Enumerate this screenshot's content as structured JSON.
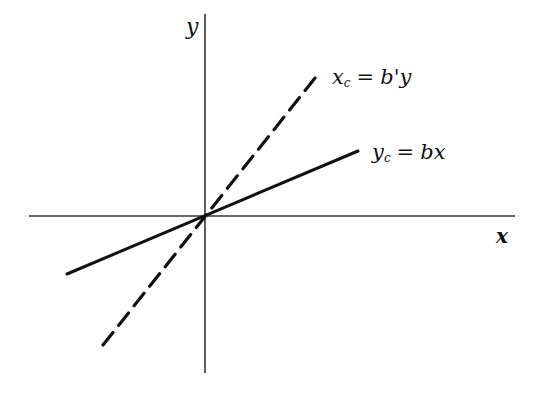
{
  "diagram": {
    "axes": {
      "x_label": "x",
      "y_label": "y",
      "origin": [
        205,
        216
      ],
      "x_axis": {
        "from": [
          29,
          216
        ],
        "to": [
          515,
          216
        ]
      },
      "y_axis": {
        "from": [
          205,
          14
        ],
        "to": [
          205,
          373
        ]
      }
    },
    "lines": [
      {
        "name": "regression-x-on-y",
        "style": "dashed",
        "from": [
          103,
          345
        ],
        "to": [
          315,
          78
        ],
        "label": {
          "var": "x",
          "sub": "c",
          "op": "=",
          "rhs": "b'y"
        }
      },
      {
        "name": "regression-y-on-x",
        "style": "solid",
        "from": [
          67,
          274
        ],
        "to": [
          358,
          151
        ],
        "label": {
          "var": "y",
          "sub": "c",
          "op": "=",
          "rhs": "bx"
        }
      }
    ],
    "colors": {
      "ink": "#111111",
      "axis": "#333333",
      "background": "#ffffff"
    }
  }
}
